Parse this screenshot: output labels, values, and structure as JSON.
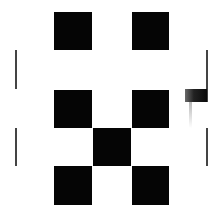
{
  "board": {
    "fill_color": "#050505",
    "background": "#ffffff",
    "squares": [
      {
        "id": "r1c1",
        "x": 54,
        "y": 12,
        "w": 38,
        "h": 38
      },
      {
        "id": "r1c3",
        "x": 132,
        "y": 12,
        "w": 37,
        "h": 38
      },
      {
        "id": "r2c1",
        "x": 54,
        "y": 90,
        "w": 38,
        "h": 38
      },
      {
        "id": "r2c3",
        "x": 132,
        "y": 90,
        "w": 37,
        "h": 38
      },
      {
        "id": "r3c2",
        "x": 93,
        "y": 128,
        "w": 38,
        "h": 38
      },
      {
        "id": "r4c1",
        "x": 54,
        "y": 166,
        "w": 38,
        "h": 39
      },
      {
        "id": "r4c3",
        "x": 132,
        "y": 166,
        "w": 37,
        "h": 39
      }
    ]
  },
  "side_lines": [
    {
      "side": "left",
      "x": 15,
      "y": 50,
      "h": 39
    },
    {
      "side": "left",
      "x": 15,
      "y": 128,
      "h": 38
    },
    {
      "side": "right",
      "x": 206,
      "y": 50,
      "h": 52
    },
    {
      "side": "right",
      "x": 206,
      "y": 128,
      "h": 38
    }
  ],
  "marker": {
    "x": 185,
    "y": 89,
    "w": 22,
    "h": 13
  }
}
